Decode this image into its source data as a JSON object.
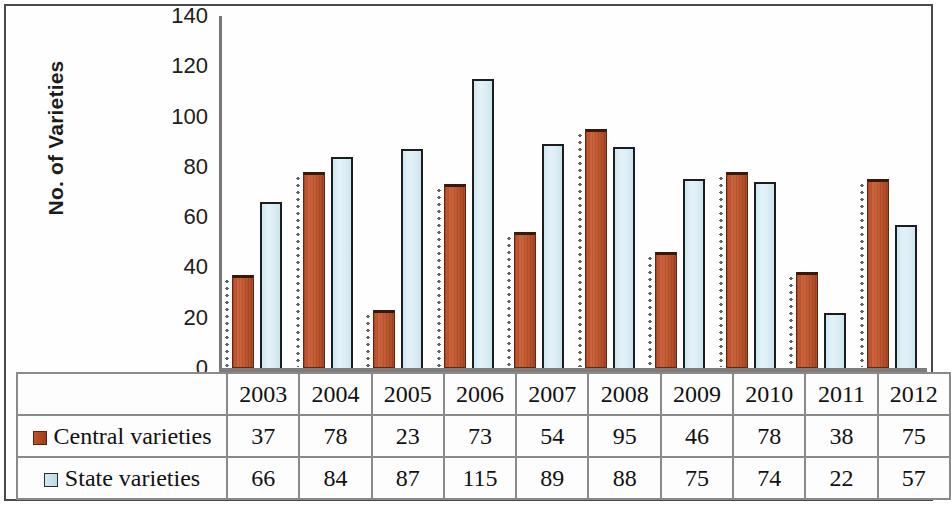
{
  "chart_data": {
    "type": "bar",
    "title": "",
    "xlabel": "",
    "ylabel": "No. of Varieties",
    "ylim": [
      0,
      140
    ],
    "ytick_step": 20,
    "yticks": [
      140,
      120,
      100,
      80,
      60,
      40,
      20,
      0
    ],
    "grid": false,
    "legend_position": "data-table-left-column",
    "categories": [
      "2003",
      "2004",
      "2005",
      "2006",
      "2007",
      "2008",
      "2009",
      "2010",
      "2011",
      "2012"
    ],
    "series": [
      {
        "name": "Central varieties",
        "color": "#bb5228",
        "marker": "central-swatch",
        "values": [
          37,
          78,
          23,
          73,
          54,
          95,
          46,
          78,
          38,
          75
        ]
      },
      {
        "name": "State varieties",
        "color": "#daedf5",
        "marker": "state-swatch",
        "values": [
          66,
          84,
          87,
          115,
          89,
          88,
          75,
          74,
          22,
          57
        ]
      }
    ]
  },
  "axis": {
    "y_title": "No. of Varieties",
    "y_tick_labels": [
      "140",
      "120",
      "100",
      "80",
      "60",
      "40",
      "20",
      "0"
    ]
  },
  "table": {
    "year_header": [
      "2003",
      "2004",
      "2005",
      "2006",
      "2007",
      "2008",
      "2009",
      "2010",
      "2011",
      "2012"
    ],
    "rows": [
      {
        "label": "Central varieties",
        "swatch": "central-swatch",
        "values": [
          "37",
          "78",
          "23",
          "73",
          "54",
          "95",
          "46",
          "78",
          "38",
          "75"
        ]
      },
      {
        "label": "State varieties",
        "swatch": "state-swatch",
        "values": [
          "66",
          "84",
          "87",
          "115",
          "89",
          "88",
          "75",
          "74",
          "22",
          "57"
        ]
      }
    ]
  }
}
